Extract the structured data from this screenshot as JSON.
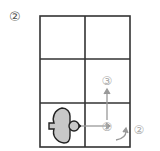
{
  "figure": {
    "label": "②",
    "grid": {
      "rows": 3,
      "cols": 2
    },
    "steps": [
      {
        "marker": "①",
        "action": "move right"
      },
      {
        "marker": "②",
        "action": "turn"
      },
      {
        "marker": "③",
        "action": "move up"
      }
    ],
    "colors": {
      "grid": "#333333",
      "bird_fill": "#c8c8c8",
      "arrow": "#999999",
      "marker": "#aaaaaa"
    }
  }
}
